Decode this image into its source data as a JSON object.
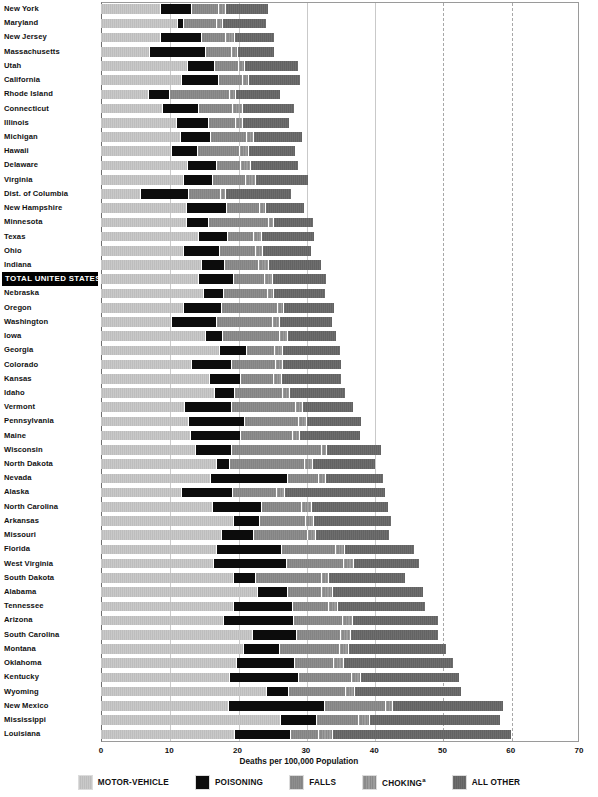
{
  "chart_data": {
    "type": "bar",
    "subtype": "stacked-horizontal",
    "title": "",
    "xlabel": "Deaths per 100,000 Population",
    "ylabel": "",
    "xlim": [
      0,
      70
    ],
    "xticks": [
      0,
      10,
      20,
      30,
      40,
      50,
      60,
      70
    ],
    "grid": true,
    "legend_position": "bottom",
    "series": [
      {
        "name": "MOTOR-VEHICLE",
        "color": "#c4c4c4"
      },
      {
        "name": "POISONING",
        "color": "#0c0c0c"
      },
      {
        "name": "FALLS",
        "color": "#8a8a8a"
      },
      {
        "name": "CHOKING*",
        "color": "#949494"
      },
      {
        "name": "ALL OTHER",
        "color": "#696969"
      }
    ],
    "categories": [
      "New York",
      "Maryland",
      "New Jersey",
      "Massachusetts",
      "Utah",
      "California",
      "Rhode Island",
      "Connecticut",
      "Illinois",
      "Michigan",
      "Hawaii",
      "Delaware",
      "Virginia",
      "Dist. of Columbia",
      "New Hampshire",
      "Minnesota",
      "Texas",
      "Ohio",
      "Indiana",
      "TOTAL UNITED STATES",
      "Nebraska",
      "Oregon",
      "Washington",
      "Iowa",
      "Georgia",
      "Colorado",
      "Kansas",
      "Idaho",
      "Vermont",
      "Pennsylvania",
      "Maine",
      "Wisconsin",
      "North Dakota",
      "Nevada",
      "Alaska",
      "North Carolina",
      "Arkansas",
      "Missouri",
      "Florida",
      "West Virginia",
      "South Dakota",
      "Alabama",
      "Tennessee",
      "Arizona",
      "South Carolina",
      "Montana",
      "Oklahoma",
      "Kentucky",
      "Wyoming",
      "New Mexico",
      "Mississippi",
      "Louisiana"
    ],
    "highlight_category": "TOTAL UNITED STATES",
    "rows": [
      {
        "label": "New York",
        "values": [
          8.7,
          4.5,
          4.0,
          0.9,
          6.4
        ],
        "total": 24.5
      },
      {
        "label": "Maryland",
        "values": [
          11.2,
          0.8,
          4.8,
          0.9,
          6.4
        ],
        "total": 24.1
      },
      {
        "label": "New Jersey",
        "values": [
          8.6,
          6.0,
          3.6,
          1.3,
          5.8
        ],
        "total": 25.3
      },
      {
        "label": "Massachusetts",
        "values": [
          7.0,
          8.2,
          3.8,
          0.9,
          5.4
        ],
        "total": 25.3
      },
      {
        "label": "Utah",
        "values": [
          12.6,
          4.0,
          3.5,
          0.9,
          7.9
        ],
        "total": 28.9
      },
      {
        "label": "California",
        "values": [
          11.7,
          5.5,
          3.5,
          0.8,
          7.6
        ],
        "total": 29.1
      },
      {
        "label": "Rhode Island",
        "values": [
          6.9,
          3.1,
          8.7,
          0.9,
          6.6
        ],
        "total": 26.2
      },
      {
        "label": "Connecticut",
        "values": [
          9.0,
          5.2,
          5.0,
          1.5,
          7.6
        ],
        "total": 28.3
      },
      {
        "label": "Illinois",
        "values": [
          11.0,
          4.6,
          4.0,
          1.1,
          6.9
        ],
        "total": 27.6
      },
      {
        "label": "Michigan",
        "values": [
          11.5,
          4.4,
          5.4,
          0.9,
          7.2
        ],
        "total": 29.4
      },
      {
        "label": "Hawaii",
        "values": [
          10.3,
          3.8,
          6.1,
          1.4,
          6.8
        ],
        "total": 28.4
      },
      {
        "label": "Delaware",
        "values": [
          12.6,
          4.2,
          3.6,
          1.4,
          7.0
        ],
        "total": 28.8
      },
      {
        "label": "Virginia",
        "values": [
          12.0,
          4.3,
          4.8,
          1.4,
          7.8
        ],
        "total": 30.3
      },
      {
        "label": "Dist. of Columbia",
        "values": [
          5.7,
          7.0,
          4.8,
          0.6,
          9.7
        ],
        "total": 27.8
      },
      {
        "label": "New Hampshire",
        "values": [
          12.4,
          5.9,
          4.9,
          0.8,
          5.8
        ],
        "total": 29.8
      },
      {
        "label": "Minnesota",
        "values": [
          12.5,
          3.1,
          8.8,
          0.8,
          5.9
        ],
        "total": 31.1
      },
      {
        "label": "Texas",
        "values": [
          14.2,
          4.3,
          3.8,
          1.1,
          7.8
        ],
        "total": 31.2
      },
      {
        "label": "Ohio",
        "values": [
          12.0,
          5.3,
          5.3,
          1.0,
          7.2
        ],
        "total": 30.8
      },
      {
        "label": "Indiana",
        "values": [
          14.6,
          3.4,
          5.0,
          1.4,
          7.8
        ],
        "total": 32.2
      },
      {
        "label": "TOTAL UNITED STATES",
        "values": [
          14.2,
          5.1,
          4.6,
          1.1,
          8.0
        ],
        "total": 33.0
      },
      {
        "label": "Nebraska",
        "values": [
          15.0,
          2.8,
          6.5,
          0.9,
          7.6
        ],
        "total": 32.8
      },
      {
        "label": "Oregon",
        "values": [
          12.0,
          5.6,
          8.2,
          0.8,
          7.5
        ],
        "total": 34.1
      },
      {
        "label": "Washington",
        "values": [
          10.2,
          6.6,
          8.3,
          0.9,
          7.8
        ],
        "total": 33.8
      },
      {
        "label": "Iowa",
        "values": [
          15.2,
          2.5,
          8.4,
          1.1,
          7.2
        ],
        "total": 34.4
      },
      {
        "label": "Georgia",
        "values": [
          17.3,
          4.0,
          4.0,
          1.2,
          8.5
        ],
        "total": 35.0
      },
      {
        "label": "Colorado",
        "values": [
          13.2,
          5.8,
          6.5,
          1.0,
          8.6
        ],
        "total": 35.1
      },
      {
        "label": "Kansas",
        "values": [
          15.8,
          4.6,
          4.8,
          1.2,
          8.8
        ],
        "total": 35.2
      },
      {
        "label": "Idaho",
        "values": [
          16.6,
          2.9,
          7.0,
          1.1,
          8.1
        ],
        "total": 35.7
      },
      {
        "label": "Vermont",
        "values": [
          12.2,
          6.8,
          9.4,
          1.0,
          7.5
        ],
        "total": 36.9
      },
      {
        "label": "Pennsylvania",
        "values": [
          12.7,
          8.3,
          7.8,
          1.2,
          8.1
        ],
        "total": 38.1
      },
      {
        "label": "Maine",
        "values": [
          13.1,
          7.3,
          7.6,
          1.0,
          9.0
        ],
        "total": 38.0
      },
      {
        "label": "Wisconsin",
        "values": [
          13.8,
          5.3,
          13.1,
          0.8,
          8.0
        ],
        "total": 41.0
      },
      {
        "label": "North Dakota",
        "values": [
          16.9,
          1.8,
          11.1,
          1.1,
          9.3
        ],
        "total": 40.2
      },
      {
        "label": "Nevada",
        "values": [
          15.9,
          11.3,
          4.6,
          1.0,
          8.5
        ],
        "total": 41.3
      },
      {
        "label": "Alaska",
        "values": [
          11.7,
          7.5,
          6.4,
          1.2,
          14.8
        ],
        "total": 41.6
      },
      {
        "label": "North Carolina",
        "values": [
          16.2,
          7.2,
          5.9,
          1.4,
          11.3
        ],
        "total": 42.0
      },
      {
        "label": "Arkansas",
        "values": [
          19.3,
          3.8,
          6.8,
          1.1,
          11.5
        ],
        "total": 42.5
      },
      {
        "label": "Missouri",
        "values": [
          17.6,
          4.7,
          7.8,
          1.2,
          10.9
        ],
        "total": 42.2
      },
      {
        "label": "Florida",
        "values": [
          16.8,
          9.6,
          7.9,
          1.3,
          10.2
        ],
        "total": 45.8
      },
      {
        "label": "West Virginia",
        "values": [
          16.4,
          10.7,
          8.4,
          1.4,
          9.7
        ],
        "total": 46.6
      },
      {
        "label": "South Dakota",
        "values": [
          19.4,
          3.2,
          9.6,
          1.1,
          11.2
        ],
        "total": 44.5
      },
      {
        "label": "Alabama",
        "values": [
          22.9,
          4.4,
          4.9,
          1.6,
          13.4
        ],
        "total": 47.2
      },
      {
        "label": "Tennessee",
        "values": [
          19.4,
          8.6,
          5.2,
          1.3,
          13.0
        ],
        "total": 47.5
      },
      {
        "label": "Arizona",
        "values": [
          17.9,
          10.2,
          7.2,
          1.4,
          12.7
        ],
        "total": 49.4
      },
      {
        "label": "South Carolina",
        "values": [
          22.1,
          6.4,
          6.5,
          1.4,
          12.9
        ],
        "total": 49.3
      },
      {
        "label": "Montana",
        "values": [
          20.8,
          5.3,
          8.8,
          1.3,
          14.3
        ],
        "total": 50.5
      },
      {
        "label": "Oklahoma",
        "values": [
          19.7,
          8.5,
          5.8,
          1.5,
          16.1
        ],
        "total": 51.6
      },
      {
        "label": "Kentucky",
        "values": [
          18.7,
          10.2,
          7.7,
          1.4,
          14.5
        ],
        "total": 52.5
      },
      {
        "label": "Wyoming",
        "values": [
          24.2,
          3.2,
          8.4,
          1.2,
          15.7
        ],
        "total": 52.7
      },
      {
        "label": "New Mexico",
        "values": [
          18.6,
          14.0,
          9.0,
          1.0,
          16.3
        ],
        "total": 58.9
      },
      {
        "label": "Mississippi",
        "values": [
          26.2,
          5.3,
          6.2,
          1.6,
          19.1
        ],
        "total": 58.4
      },
      {
        "label": "Louisiana",
        "values": [
          19.5,
          8.2,
          4.1,
          2.0,
          26.2
        ],
        "total": 60.0
      }
    ]
  },
  "axis": {
    "xlabel": "Deaths per 100,000 Population",
    "ticks": [
      "0",
      "10",
      "20",
      "30",
      "40",
      "50",
      "60",
      "70"
    ]
  },
  "legend": {
    "items": [
      {
        "label": "MOTOR-VEHICLE",
        "key": "motor",
        "color": "#c4c4c4"
      },
      {
        "label": "POISONING",
        "key": "poison",
        "color": "#0c0c0c"
      },
      {
        "label": "FALLS",
        "key": "falls",
        "color": "#8a8a8a"
      },
      {
        "label": "CHOKING",
        "key": "choking",
        "color": "#949494",
        "footnote": "a"
      },
      {
        "label": "ALL OTHER",
        "key": "other",
        "color": "#696969"
      }
    ]
  }
}
